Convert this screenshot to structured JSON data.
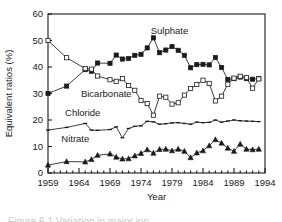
{
  "figure": {
    "background_color": "#ffffff",
    "ink_color": "#1a1a1a",
    "caption_clipped": "Figure 6.1 Variation in major ion"
  },
  "axes": {
    "y_title": "Equivalent ratios (%)",
    "x_title": "Year",
    "y_ticks": [
      "0",
      "10",
      "20",
      "30",
      "40",
      "50",
      "60"
    ],
    "x_ticks": [
      "1959",
      "1964",
      "1969",
      "1974",
      "1979",
      "1984",
      "1989",
      "1994"
    ],
    "frame": true,
    "grid": false
  },
  "chart_data": {
    "type": "line",
    "title": "",
    "xlabel": "Year",
    "ylabel": "Equivalent ratios (%)",
    "xlim": [
      1959,
      1994
    ],
    "ylim": [
      0,
      60
    ],
    "y_ticks": [
      0,
      10,
      20,
      30,
      40,
      50,
      60
    ],
    "x_ticks": [
      1959,
      1964,
      1969,
      1974,
      1979,
      1984,
      1989,
      1994
    ],
    "grid": false,
    "legend_position": "inline-annotations",
    "x": [
      1959,
      1962,
      1965,
      1966,
      1967,
      1969,
      1970,
      1971,
      1972,
      1973,
      1974,
      1975,
      1976,
      1977,
      1978,
      1979,
      1980,
      1981,
      1982,
      1983,
      1984,
      1985,
      1986,
      1987,
      1988,
      1989,
      1990,
      1991,
      1992,
      1993
    ],
    "series": [
      {
        "name": "Sulphate",
        "marker": "filled-square",
        "color": "#1a1a1a",
        "values": [
          30.0,
          32.8,
          39.0,
          38.4,
          41.5,
          41.4,
          44.5,
          43.0,
          43.2,
          44.4,
          44.8,
          47.2,
          51.0,
          45.4,
          46.4,
          47.7,
          46.3,
          44.4,
          39.7,
          40.9,
          41.0,
          40.8,
          43.6,
          39.8,
          35.3,
          35.6,
          36.2,
          35.6,
          35.4,
          35.6
        ]
      },
      {
        "name": "Bicarbonate",
        "marker": "open-square",
        "color": "#1a1a1a",
        "values": [
          50.0,
          43.5,
          39.4,
          39.2,
          36.6,
          35.2,
          34.6,
          35.6,
          33.0,
          31.2,
          27.4,
          26.2,
          21.8,
          29.0,
          28.6,
          26.0,
          26.5,
          29.4,
          31.9,
          33.4,
          35.0,
          33.8,
          27.2,
          29.0,
          33.5,
          35.8,
          36.5,
          36.0,
          32.0,
          35.5
        ]
      },
      {
        "name": "Chloride",
        "marker": "tick",
        "color": "#1a1a1a",
        "values": [
          16.2,
          17.2,
          18.7,
          16.2,
          16.1,
          16.4,
          17.4,
          13.3,
          16.8,
          17.6,
          17.8,
          19.5,
          19.3,
          18.4,
          18.6,
          18.9,
          19.0,
          18.7,
          18.4,
          19.2,
          19.0,
          19.1,
          20.0,
          19.2,
          19.6,
          20.0,
          19.7,
          19.6,
          19.5,
          19.4
        ]
      },
      {
        "name": "Nitrate",
        "marker": "filled-triangle",
        "color": "#1a1a1a",
        "values": [
          3.0,
          4.3,
          4.2,
          5.1,
          6.7,
          7.2,
          6.0,
          5.3,
          5.4,
          6.5,
          7.4,
          8.8,
          7.5,
          8.9,
          9.0,
          8.4,
          9.0,
          8.2,
          5.8,
          7.6,
          8.4,
          10.3,
          12.6,
          11.3,
          9.4,
          8.2,
          10.9,
          9.0,
          8.8,
          9.0
        ]
      }
    ],
    "annotations": [
      {
        "text": "Sulphate",
        "x": 1978.6,
        "y": 52.5
      },
      {
        "text": "Bicarbonate",
        "x": 1968.4,
        "y": 28.6
      },
      {
        "text": "Chloride",
        "x": 1964.6,
        "y": 21.4
      },
      {
        "text": "Nitrate",
        "x": 1963.4,
        "y": 11.6
      }
    ]
  }
}
